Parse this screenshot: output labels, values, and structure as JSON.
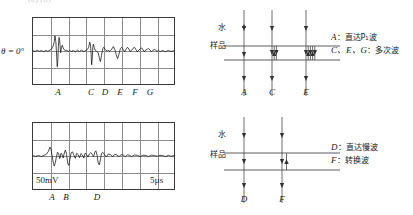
{
  "figure": {
    "top_cropped_text": "(a)           (b)",
    "panels": {
      "top_left": {
        "name": "oscilloscope-trace-theta-0",
        "angle_label": "θ = 0°",
        "axis_letters": [
          "A",
          "C",
          "D",
          "E",
          "F",
          "G"
        ],
        "grid": {
          "columns": 8,
          "rows": 4
        }
      },
      "bottom_left": {
        "name": "oscilloscope-trace-slow",
        "voltage_scale": "50mV",
        "time_scale": "5µs",
        "axis_letters": [
          "A",
          "B",
          "D"
        ],
        "grid": {
          "columns": 8,
          "rows": 4
        }
      },
      "top_right": {
        "name": "ray-path-diagram-fast",
        "medium_top": "水",
        "medium_bottom": "样品",
        "ray_letters": [
          "A",
          "C",
          "E"
        ],
        "legend": [
          {
            "symbol": "A",
            "text": "直达P₁波"
          },
          {
            "symbol": "C、E、G",
            "text": "多次波"
          }
        ]
      },
      "bottom_right": {
        "name": "ray-path-diagram-slow",
        "medium_top": "水",
        "medium_bottom": "样品",
        "ray_letters": [
          "D",
          "F"
        ],
        "legend": [
          {
            "symbol": "D",
            "text": "直达慢波"
          },
          {
            "symbol": "F",
            "text": "转换波"
          }
        ]
      }
    },
    "colors": {
      "trace": "#1a1a1a",
      "grid": "#8c8c8c",
      "frame": "#3a3a3a",
      "interface": "#4a4a4a"
    }
  },
  "chart_data": [
    {
      "type": "line",
      "name": "theta-0-waveform",
      "title": "",
      "xlabel": "",
      "ylabel": "",
      "xlim": [
        0,
        100
      ],
      "ylim": [
        -1,
        1
      ],
      "grid": true,
      "annotations": [
        {
          "label": "A",
          "x": 18.0
        },
        {
          "label": "C",
          "x": 41.0
        },
        {
          "label": "D",
          "x": 51.0
        },
        {
          "label": "E",
          "x": 61.0
        },
        {
          "label": "F",
          "x": 71.5
        },
        {
          "label": "G",
          "x": 82.0
        }
      ],
      "series": [
        {
          "name": "theta=0 trace",
          "x": [
            0,
            1.5,
            3,
            4.5,
            6,
            7.5,
            9,
            10.5,
            12,
            13,
            14,
            15,
            15.6,
            16.2,
            16.8,
            17.2,
            17.6,
            18,
            18.4,
            18.8,
            19.2,
            19.6,
            20.2,
            20.8,
            21.4,
            22,
            22.6,
            23.2,
            24,
            25,
            26,
            27,
            28.5,
            30,
            31.5,
            33,
            34.5,
            36,
            37.5,
            38.5,
            39.5,
            40.2,
            40.8,
            41.2,
            41.6,
            42,
            42.4,
            42.8,
            43.4,
            44,
            44.6,
            45.4,
            46.2,
            47,
            47.8,
            48.6,
            49.4,
            50.2,
            51,
            51.8,
            52.6,
            53.4,
            54.2,
            55,
            56,
            57,
            58,
            59,
            60,
            61,
            62,
            63,
            64,
            65,
            66,
            67,
            68,
            69,
            70,
            71,
            72,
            73,
            74,
            75,
            76,
            77,
            78,
            79,
            80,
            81,
            82,
            83,
            84,
            85,
            86,
            87,
            88,
            89,
            90,
            92,
            94,
            96,
            98,
            100
          ],
          "y": [
            0.02,
            -0.03,
            0.04,
            -0.02,
            0.03,
            -0.04,
            0.03,
            -0.02,
            0.05,
            0.1,
            0.22,
            0.5,
            0.88,
            0.55,
            -0.3,
            -0.92,
            -0.55,
            0.25,
            0.8,
            0.72,
            0.3,
            -0.1,
            0.22,
            0.34,
            0.18,
            0.08,
            0.05,
            0.02,
            0.04,
            -0.03,
            0.05,
            -0.04,
            0.03,
            -0.05,
            0.04,
            -0.03,
            0.05,
            -0.04,
            0.03,
            0.08,
            0.22,
            0.52,
            0.4,
            -0.2,
            -0.8,
            -0.45,
            0.18,
            0.4,
            0.22,
            0.06,
            0.03,
            -0.05,
            -0.1,
            -0.38,
            -0.62,
            -0.25,
            0.12,
            0.22,
            0.1,
            0.04,
            -0.02,
            0.05,
            -0.03,
            0.04,
            0.12,
            0.26,
            0.1,
            -0.22,
            -0.45,
            -0.18,
            0.14,
            0.22,
            0.08,
            -0.05,
            0.1,
            0.22,
            0.12,
            -0.04,
            0.06,
            0.16,
            0.22,
            0.08,
            -0.06,
            0.05,
            0.12,
            0.18,
            0.08,
            -0.04,
            0.06,
            0.1,
            0.14,
            0.06,
            -0.05,
            0.04,
            0.08,
            0.05,
            -0.03,
            0.05,
            -0.04,
            0.03,
            -0.04,
            0.03,
            -0.03,
            0.02
          ]
        }
      ]
    },
    {
      "type": "line",
      "name": "slow-wave-waveform",
      "title": "",
      "xlabel": "",
      "ylabel": "",
      "xlim": [
        0,
        100
      ],
      "ylim": [
        -1,
        1
      ],
      "grid": true,
      "annotations": [
        {
          "label": "A",
          "x": 14.0
        },
        {
          "label": "B",
          "x": 23.0
        },
        {
          "label": "D",
          "x": 44.5
        }
      ],
      "series": [
        {
          "name": "50mV / 5us trace",
          "x": [
            0,
            2,
            4,
            6,
            8,
            9.5,
            11,
            12,
            12.8,
            13.5,
            14.2,
            15,
            15.8,
            16.6,
            17.4,
            18.2,
            19,
            19.8,
            20.6,
            21.4,
            22.2,
            23,
            23.8,
            24.6,
            25.4,
            26.2,
            27,
            28,
            29,
            30,
            31,
            32,
            33,
            34,
            35,
            36,
            37,
            38,
            39,
            40,
            41,
            42,
            43,
            43.8,
            44.6,
            45.4,
            46.2,
            47,
            47.8,
            48.6,
            49.4,
            50.5,
            52,
            53.5,
            55,
            56.5,
            58,
            59.5,
            61,
            62.5,
            64,
            65.5,
            67,
            68.5,
            70,
            72,
            74,
            76,
            78,
            80,
            82,
            84,
            86,
            88,
            90,
            92,
            94,
            96,
            98,
            100
          ],
          "y": [
            0.02,
            -0.02,
            0.03,
            -0.03,
            0.04,
            0.1,
            0.28,
            0.52,
            0.4,
            0.05,
            -0.3,
            -0.58,
            -0.4,
            -0.05,
            0.22,
            0.12,
            -0.15,
            0.16,
            0.1,
            -0.12,
            0.18,
            0.35,
            0.1,
            -0.42,
            -0.55,
            -0.2,
            0.18,
            0.24,
            0.06,
            -0.14,
            0.16,
            0.08,
            -0.1,
            0.14,
            0.06,
            -0.12,
            0.16,
            0.08,
            -0.06,
            0.12,
            0.2,
            0.1,
            -0.05,
            0.22,
            0.3,
            0.06,
            -0.38,
            -0.52,
            -0.22,
            0.16,
            0.22,
            0.1,
            -0.06,
            0.12,
            0.08,
            -0.05,
            0.1,
            0.06,
            -0.04,
            0.08,
            0.05,
            -0.04,
            0.07,
            0.04,
            -0.03,
            0.06,
            0.04,
            -0.03,
            0.05,
            0.03,
            -0.03,
            0.05,
            0.03,
            -0.02,
            0.04,
            0.02,
            -0.03,
            0.04,
            -0.02,
            0.03,
            0.02
          ]
        }
      ]
    }
  ]
}
